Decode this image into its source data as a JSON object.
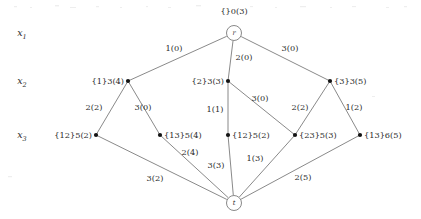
{
  "figure": {
    "kind": "layered-graph-diagram",
    "background_color": "#ffffff",
    "line_color": "#6b6b6b",
    "node_color": "#141414",
    "text_color": "#2b2b2b"
  },
  "row_labels": [
    {
      "base": "x",
      "sub": "1",
      "x": 22,
      "y": 36
    },
    {
      "base": "x",
      "sub": "2",
      "x": 22,
      "y": 84
    },
    {
      "base": "x",
      "sub": "3",
      "x": 22,
      "y": 138
    }
  ],
  "terminals": {
    "root": {
      "id": "r",
      "label": "r",
      "x": 234,
      "y": 33,
      "radius": 7.5,
      "caption": "{}0(3)",
      "caption_x": 234,
      "caption_y": 14
    },
    "sink": {
      "id": "t",
      "label": "t",
      "x": 234,
      "y": 203,
      "radius": 7.5
    }
  },
  "nodes": [
    {
      "id": "n1",
      "label": "{1}3(4)",
      "x": 128,
      "y": 81,
      "label_anchor": "end",
      "label_x": 124,
      "label_y": 84
    },
    {
      "id": "n2",
      "label": "{2}3(3)",
      "x": 228,
      "y": 81,
      "label_anchor": "end",
      "label_x": 224,
      "label_y": 84
    },
    {
      "id": "n3",
      "label": "{3}3(5)",
      "x": 330,
      "y": 81,
      "label_anchor": "start",
      "label_x": 334,
      "label_y": 84
    },
    {
      "id": "n12a",
      "label": "{12}5(2)",
      "x": 96,
      "y": 135,
      "label_anchor": "end",
      "label_x": 92,
      "label_y": 138
    },
    {
      "id": "n13a",
      "label": "{13}5(4)",
      "x": 160,
      "y": 135,
      "label_anchor": "start",
      "label_x": 164,
      "label_y": 138
    },
    {
      "id": "n12b",
      "label": "{12}5(2)",
      "x": 228,
      "y": 135,
      "label_anchor": "start",
      "label_x": 232,
      "label_y": 138
    },
    {
      "id": "n23",
      "label": "{23}5(3)",
      "x": 295,
      "y": 135,
      "label_anchor": "start",
      "label_x": 299,
      "label_y": 138
    },
    {
      "id": "n13b",
      "label": "{13}6(5)",
      "x": 360,
      "y": 135,
      "label_anchor": "start",
      "label_x": 364,
      "label_y": 138
    }
  ],
  "edges": [
    {
      "from": "r",
      "to": "n1",
      "label": "1(0)",
      "label_x": 174,
      "label_y": 51
    },
    {
      "from": "r",
      "to": "n2",
      "label": "2(0)",
      "label_x": 244,
      "label_y": 60
    },
    {
      "from": "r",
      "to": "n3",
      "label": "3(0)",
      "label_x": 290,
      "label_y": 51
    },
    {
      "from": "n1",
      "to": "n12a",
      "label": "2(2)",
      "label_x": 94,
      "label_y": 110
    },
    {
      "from": "n1",
      "to": "n13a",
      "label": "3(0)",
      "label_x": 143,
      "label_y": 110
    },
    {
      "from": "n2",
      "to": "n12b",
      "label": "1(1)",
      "label_x": 215,
      "label_y": 112
    },
    {
      "from": "n2",
      "to": "n23",
      "label": "3(0)",
      "label_x": 260,
      "label_y": 101
    },
    {
      "from": "n3",
      "to": "n23",
      "label": "2(2)",
      "label_x": 300,
      "label_y": 110
    },
    {
      "from": "n3",
      "to": "n13b",
      "label": "1(2)",
      "label_x": 354,
      "label_y": 110
    },
    {
      "from": "n12a",
      "to": "t",
      "label": "3(2)",
      "label_x": 155,
      "label_y": 181
    },
    {
      "from": "n13a",
      "to": "t",
      "label": "2(4)",
      "label_x": 190,
      "label_y": 155
    },
    {
      "from": "n12b",
      "to": "t",
      "label": "3(3)",
      "label_x": 216,
      "label_y": 168
    },
    {
      "from": "n23",
      "to": "t",
      "label": "1(3)",
      "label_x": 255,
      "label_y": 161
    },
    {
      "from": "n13b",
      "to": "t",
      "label": "2(5)",
      "label_x": 303,
      "label_y": 180
    }
  ]
}
